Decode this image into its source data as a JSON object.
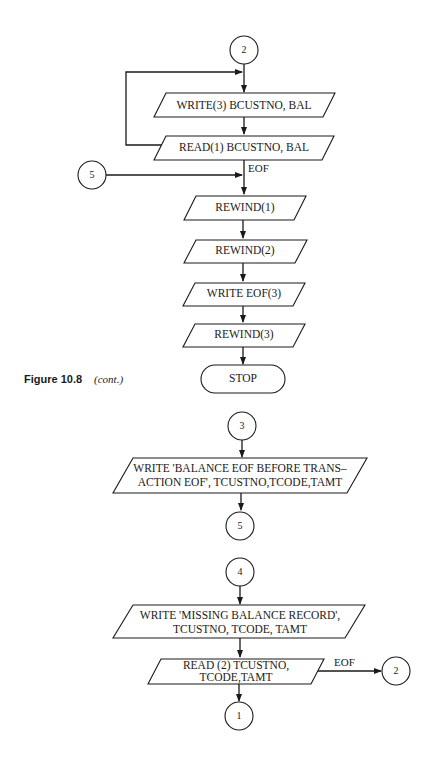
{
  "caption": {
    "figure": "Figure 10.8",
    "note": "(cont.)"
  },
  "flow_upper": {
    "entry_connector": "2",
    "write3": "WRITE(3) BCUSTNO, BAL",
    "read1": "READ(1) BCUSTNO, BAL",
    "eof_label": "EOF",
    "side_connector": "5",
    "rewind1": "REWIND(1)",
    "rewind2": "REWIND(2)",
    "write_eof3": "WRITE EOF(3)",
    "rewind3": "REWIND(3)",
    "stop": "STOP"
  },
  "flow_middle": {
    "entry_connector": "3",
    "write_line1": "WRITE 'BALANCE EOF BEFORE TRANS–",
    "write_line2": "ACTION EOF', TCUSTNO,TCODE,TAMT",
    "exit_connector": "5"
  },
  "flow_lower": {
    "entry_connector": "4",
    "write_line1": "WRITE 'MISSING BALANCE RECORD',",
    "write_line2": "TCUSTNO, TCODE, TAMT",
    "read2_line1": "READ (2) TCUSTNO,",
    "read2_line2": "TCODE,TAMT",
    "eof_label": "EOF",
    "eof_connector": "2",
    "exit_connector": "1"
  }
}
